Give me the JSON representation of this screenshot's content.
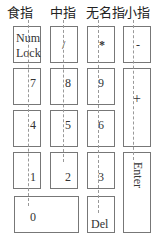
{
  "fingers": [
    {
      "label": "食指"
    },
    {
      "label": "中指"
    },
    {
      "label": "无名指"
    },
    {
      "label": "小指"
    }
  ],
  "keys": {
    "numlock": {
      "line1": "Num",
      "line2": "Lock"
    },
    "divide": "/",
    "multiply": "*",
    "minus": "-",
    "k7": "7",
    "k8": "8",
    "k9": "9",
    "plus": "+",
    "k4": "4",
    "k5": "5",
    "k6": "6",
    "k1": "1",
    "k2": "2",
    "k3": "3",
    "enter": "Enter",
    "k0": "0",
    "del": "Del"
  }
}
